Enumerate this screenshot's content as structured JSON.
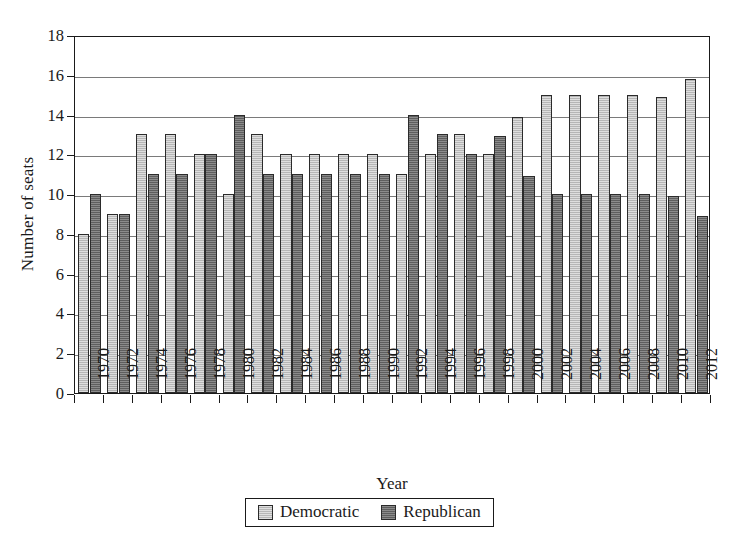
{
  "chart_data": {
    "type": "bar",
    "title": "",
    "xlabel": "Year",
    "ylabel": "Number of seats",
    "ylim": [
      0,
      18
    ],
    "yticks": [
      0,
      2,
      4,
      6,
      8,
      10,
      12,
      14,
      16,
      18
    ],
    "grid": true,
    "legend_position": "bottom-center",
    "categories": [
      "1970",
      "1972",
      "1974",
      "1976",
      "1978",
      "1980",
      "1982",
      "1984",
      "1986",
      "1988",
      "1990",
      "1992",
      "1994",
      "1996",
      "1998",
      "2000",
      "2002",
      "2004",
      "2006",
      "2008",
      "2010",
      "2012"
    ],
    "series": [
      {
        "name": "Democratic",
        "color": "#b6b6b6",
        "values": [
          8,
          9,
          13,
          13,
          12,
          10,
          13,
          12,
          12,
          12,
          12,
          11,
          12,
          13,
          12,
          13.9,
          15,
          15,
          15,
          15,
          14.9,
          15.8
        ]
      },
      {
        "name": "Republican",
        "color": "#5e5e5e",
        "values": [
          10,
          9,
          11,
          11,
          12,
          14,
          11,
          11,
          11,
          11,
          11,
          14,
          13,
          12,
          12.9,
          10.9,
          10,
          10,
          10,
          10,
          9.9,
          8.9
        ]
      }
    ]
  },
  "legend": {
    "items": [
      {
        "label": "Democratic",
        "swatch": "dem"
      },
      {
        "label": "Republican",
        "swatch": "rep"
      }
    ]
  }
}
